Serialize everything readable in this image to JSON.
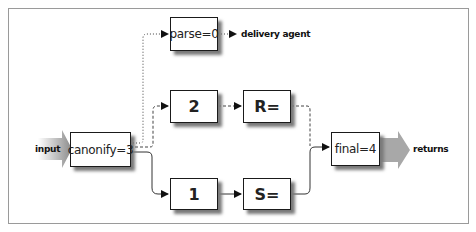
{
  "diagram": {
    "type": "ruleset flow",
    "nodes": {
      "canonify": "canonify=3",
      "parse": "parse=0",
      "two": "2",
      "r": "R=",
      "one": "1",
      "s": "S=",
      "final": "final=4"
    },
    "labels": {
      "input": "input",
      "delivery": "delivery agent",
      "returns": "returns"
    },
    "edges": [
      {
        "from": "canonify=3",
        "to": "parse=0",
        "style": "dotted"
      },
      {
        "from": "canonify=3",
        "to": "2",
        "style": "dashed"
      },
      {
        "from": "canonify=3",
        "to": "1",
        "style": "solid"
      },
      {
        "from": "parse=0",
        "to": "delivery agent",
        "style": "dotted"
      },
      {
        "from": "2",
        "to": "R=",
        "style": "dashed"
      },
      {
        "from": "1",
        "to": "S=",
        "style": "solid"
      },
      {
        "from": "R=",
        "to": "final=4",
        "style": "dashed"
      },
      {
        "from": "S=",
        "to": "final=4",
        "style": "solid"
      }
    ],
    "colors": {
      "frame": "#9a9a9a",
      "box_border": "#1a1a1a",
      "shadow": "#7a7a7a",
      "big_arrow": "#a8a8a8"
    }
  }
}
